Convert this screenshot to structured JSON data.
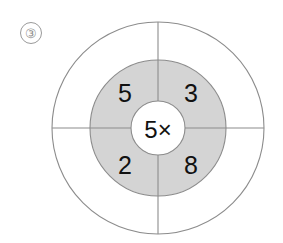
{
  "page": {
    "background_color": "#ffffff",
    "width": 283,
    "height": 243
  },
  "problem": {
    "number_label": "③",
    "number": 3
  },
  "diagram": {
    "type": "multiplication-target-wheel",
    "center": {
      "x": 158,
      "y": 128
    },
    "outer_ring": {
      "radius": 106,
      "fill_color": "#ffffff",
      "stroke_color": "#8c8c8c"
    },
    "middle_ring": {
      "radius": 68,
      "fill_color": "#d4d4d4",
      "stroke_color": "#8c8c8c"
    },
    "inner_circle": {
      "radius": 27,
      "fill_color": "#ffffff",
      "stroke_color": "#8c8c8c"
    },
    "center_label": "5×",
    "center_multiplier": 5,
    "operator": "×",
    "quadrants": [
      {
        "position": "top-left",
        "value": "5",
        "x": 125,
        "y": 93
      },
      {
        "position": "top-right",
        "value": "3",
        "x": 191,
        "y": 93
      },
      {
        "position": "bottom-left",
        "value": "2",
        "x": 125,
        "y": 165
      },
      {
        "position": "bottom-right",
        "value": "8",
        "x": 191,
        "y": 165
      }
    ],
    "divider_lines": [
      {
        "orientation": "vertical",
        "x1": 158,
        "y1": 22,
        "x2": 158,
        "y2": 234
      },
      {
        "orientation": "horizontal",
        "x1": 52,
        "y1": 128,
        "x2": 264,
        "y2": 128
      }
    ]
  }
}
